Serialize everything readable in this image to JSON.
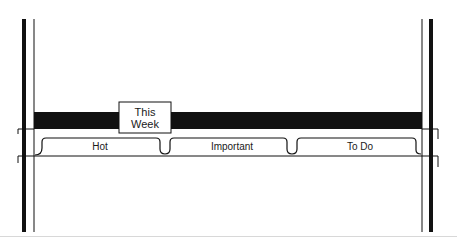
{
  "diagram": {
    "title_box": {
      "line1": "This",
      "line2": "Week"
    },
    "tabs": [
      {
        "label": "Hot"
      },
      {
        "label": "Important"
      },
      {
        "label": "To Do"
      }
    ],
    "colors": {
      "ink": "#111111",
      "paper": "#ffffff"
    }
  }
}
